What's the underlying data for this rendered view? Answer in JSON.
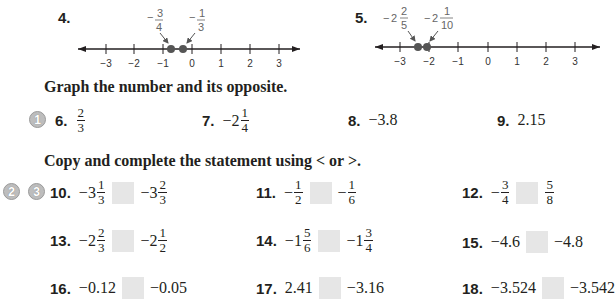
{
  "problems_number_lines": [
    {
      "number": "4.",
      "ticks": [
        "−3",
        "−2",
        "−1",
        "0",
        "1",
        "2",
        "3"
      ],
      "points": [
        {
          "label_sign": "−",
          "label_whole": "",
          "label_num": "3",
          "label_den": "4",
          "value": -0.75
        },
        {
          "label_sign": "−",
          "label_whole": "",
          "label_num": "1",
          "label_den": "3",
          "value": -0.3333
        }
      ]
    },
    {
      "number": "5.",
      "ticks": [
        "−3",
        "−2",
        "−1",
        "0",
        "1",
        "2",
        "3"
      ],
      "points": [
        {
          "label_sign": "−",
          "label_whole": "2",
          "label_num": "2",
          "label_den": "5",
          "value": -2.4
        },
        {
          "label_sign": "−",
          "label_whole": "2",
          "label_num": "1",
          "label_den": "10",
          "value": -2.1
        }
      ]
    }
  ],
  "section1": {
    "heading": "Graph the number and its opposite.",
    "badges": [
      "1"
    ],
    "items": [
      {
        "number": "6.",
        "sign": "",
        "whole": "",
        "num": "2",
        "den": "3"
      },
      {
        "number": "7.",
        "sign": "−",
        "whole": "2",
        "num": "1",
        "den": "4"
      },
      {
        "number": "8.",
        "text": "−3.8"
      },
      {
        "number": "9.",
        "text": "2.15"
      }
    ]
  },
  "section2": {
    "heading": "Copy and complete the statement using < or >.",
    "badges": [
      "2",
      "3"
    ],
    "items": [
      {
        "number": "10.",
        "left": {
          "sign": "−",
          "whole": "3",
          "num": "1",
          "den": "3"
        },
        "right": {
          "sign": "−",
          "whole": "3",
          "num": "2",
          "den": "3"
        }
      },
      {
        "number": "11.",
        "left": {
          "sign": "−",
          "whole": "",
          "num": "1",
          "den": "2"
        },
        "right": {
          "sign": "−",
          "whole": "",
          "num": "1",
          "den": "6"
        }
      },
      {
        "number": "12.",
        "left": {
          "sign": "−",
          "whole": "",
          "num": "3",
          "den": "4"
        },
        "right": {
          "sign": "",
          "whole": "",
          "num": "5",
          "den": "8"
        }
      },
      {
        "number": "13.",
        "left": {
          "sign": "−",
          "whole": "2",
          "num": "2",
          "den": "3"
        },
        "right": {
          "sign": "−",
          "whole": "2",
          "num": "1",
          "den": "2"
        }
      },
      {
        "number": "14.",
        "left": {
          "sign": "−",
          "whole": "1",
          "num": "5",
          "den": "6"
        },
        "right": {
          "sign": "−",
          "whole": "1",
          "num": "3",
          "den": "4"
        }
      },
      {
        "number": "15.",
        "left_text": "−4.6",
        "right_text": "−4.8"
      },
      {
        "number": "16.",
        "left_text": "−0.12",
        "right_text": "−0.05"
      },
      {
        "number": "17.",
        "left_text": "2.41",
        "right_text": "−3.16"
      },
      {
        "number": "18.",
        "left_text": "−3.524",
        "right_text": "−3.542"
      }
    ]
  },
  "colors": {
    "text": "#231f20",
    "blank_box": "#e6e6e6",
    "badge": "#bdbdbd",
    "dot": "#555555",
    "annotation": "#666666"
  }
}
